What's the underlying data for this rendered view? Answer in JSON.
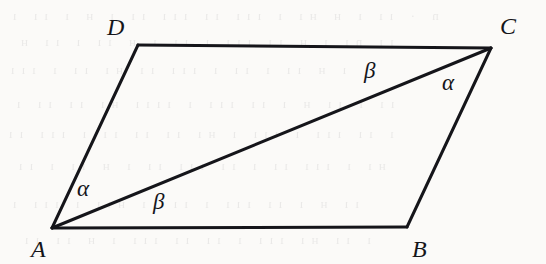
{
  "figure": {
    "background_color": "#fbfaf8",
    "stroke_color": "#15151a",
    "canvas": {
      "width": 546,
      "height": 264
    }
  },
  "vertices": [
    {
      "id": "A",
      "label": "A",
      "x": 52,
      "y": 228,
      "label_x": 31,
      "label_y": 237
    },
    {
      "id": "B",
      "label": "B",
      "x": 407,
      "y": 227,
      "label_x": 412,
      "label_y": 237
    },
    {
      "id": "C",
      "label": "C",
      "x": 491,
      "y": 48,
      "label_x": 500,
      "label_y": 14
    },
    {
      "id": "D",
      "label": "D",
      "x": 138,
      "y": 45,
      "label_x": 107,
      "label_y": 15
    }
  ],
  "edges": [
    {
      "id": "AB",
      "from": "A",
      "to": "B",
      "stroke_width": 3.0
    },
    {
      "id": "BC",
      "from": "B",
      "to": "C",
      "stroke_width": 3.0
    },
    {
      "id": "CD",
      "from": "C",
      "to": "D",
      "stroke_width": 3.0
    },
    {
      "id": "DA",
      "from": "D",
      "to": "A",
      "stroke_width": 3.0
    }
  ],
  "diagonal": {
    "id": "AC",
    "from": "A",
    "to": "C",
    "stroke_width": 3.0
  },
  "angle_labels": [
    {
      "id": "alpha-at-A",
      "symbol": "α",
      "at_vertex": "A",
      "between": "AD and AC",
      "x": 77,
      "y": 177
    },
    {
      "id": "beta-at-A",
      "symbol": "β",
      "at_vertex": "A",
      "between": "AC and AB",
      "x": 153,
      "y": 190
    },
    {
      "id": "beta-at-C",
      "symbol": "β",
      "at_vertex": "C",
      "between": "CD and CA",
      "x": 364,
      "y": 59
    },
    {
      "id": "alpha-at-C",
      "symbol": "α",
      "at_vertex": "C",
      "between": "CA and CB",
      "x": 442,
      "y": 71
    }
  ],
  "ghost_text": {
    "description": "faint bleed-through text from reverse page",
    "rows": [
      {
        "text": "n  · ıı   ı  н    нı ı ııı  ıı ııı ıı ı н  ı ıı ı",
        "x": 6,
        "y": 8
      },
      {
        "text": "ıı  nı  ı н   ıı  ııı ı  ıı  ı н ıı ı ıı н",
        "x": 14,
        "y": 34
      },
      {
        "text": "ı  н ıı ı  ıı ı  ııı   ıı нı ıı ı  ııı",
        "x": 4,
        "y": 62
      },
      {
        "text": "ıı ı  ıı  н    ı ıı ııı ı  ıııı  нı ıı  ıı ı",
        "x": 10,
        "y": 96
      },
      {
        "text": "ı  ıı ııı ı  ııı ı нı ıı  ıı ıı  ı ııı  ıı",
        "x": 2,
        "y": 126
      },
      {
        "text": "нı ı  ııı ıı  ı ıı ııı  ıı ı н  ıı ı ıı",
        "x": 12,
        "y": 158
      },
      {
        "text": "ıı н  ı ıı  ııı ı  ıı ıı  нıı ı ııı ı",
        "x": 6,
        "y": 196
      },
      {
        "text": "ı ıı нı  ııı  ı ıı  ıı ııı ı н ıı  ıı",
        "x": 18,
        "y": 232
      }
    ]
  }
}
